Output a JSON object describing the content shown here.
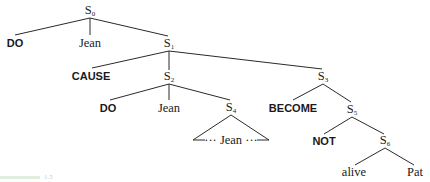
{
  "diagram": {
    "type": "syntax-tree",
    "nodes": {
      "s0": {
        "base": "S",
        "sub": "0"
      },
      "s1": {
        "base": "S",
        "sub": "1"
      },
      "s2": {
        "base": "S",
        "sub": "2"
      },
      "s3": {
        "base": "S",
        "sub": "3"
      },
      "s4": {
        "base": "S",
        "sub": "4"
      },
      "s5": {
        "base": "S",
        "sub": "5"
      },
      "s6": {
        "base": "S",
        "sub": "6"
      }
    },
    "leaves": {
      "do_top": "DO",
      "jean_top": "Jean",
      "cause": "CAUSE",
      "do_mid": "DO",
      "jean_mid": "Jean",
      "triangle_content": "··· Jean ···",
      "become": "BECOME",
      "not": "NOT",
      "alive": "alive",
      "pat": "Pat"
    },
    "edges": [
      [
        "S0",
        "DO"
      ],
      [
        "S0",
        "Jean"
      ],
      [
        "S0",
        "S1"
      ],
      [
        "S1",
        "CAUSE"
      ],
      [
        "S1",
        "S2"
      ],
      [
        "S1",
        "S3"
      ],
      [
        "S2",
        "DO"
      ],
      [
        "S2",
        "Jean"
      ],
      [
        "S2",
        "S4"
      ],
      [
        "S4",
        "triangle(··· Jean ···)"
      ],
      [
        "S3",
        "BECOME"
      ],
      [
        "S3",
        "S5"
      ],
      [
        "S5",
        "NOT"
      ],
      [
        "S5",
        "S6"
      ],
      [
        "S6",
        "alive"
      ],
      [
        "S6",
        "Pat"
      ]
    ],
    "caption_fragment": "1.5"
  }
}
